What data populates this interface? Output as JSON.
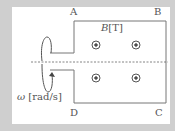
{
  "diagram": {
    "corners": {
      "A": "A",
      "B": "B",
      "C": "C",
      "D": "D"
    },
    "field_label": {
      "symbol": "B",
      "unit": "[T]"
    },
    "rotation_label": {
      "symbol": "ω",
      "unit": "[rad/s]"
    },
    "field_direction": "out-of-page",
    "field_markers": 4,
    "axis": "dashed horizontal rotation axis",
    "colors": {
      "background": "#cfcfcf",
      "panel": "#ffffff",
      "line": "#777777"
    }
  }
}
